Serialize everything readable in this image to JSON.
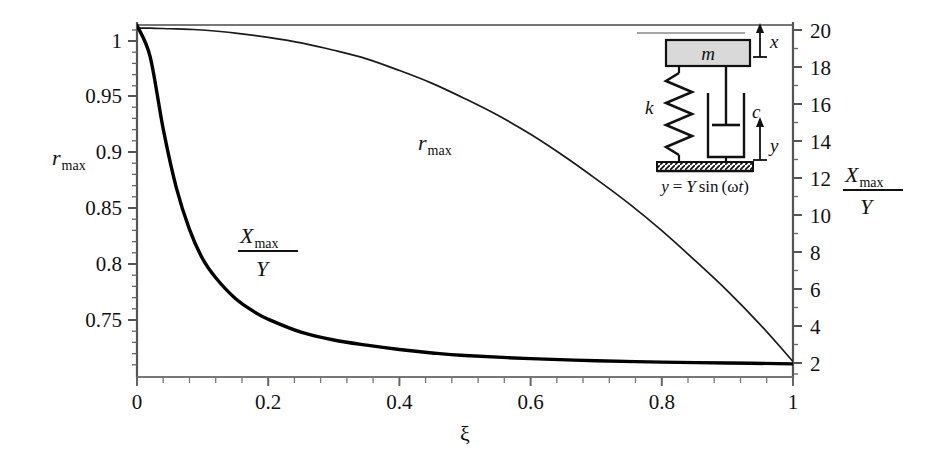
{
  "figure": {
    "name": "rmax-and-Xmax-over-Y-versus-damping-ratio",
    "background": "#ffffff",
    "axis_color": "#555555",
    "curve_color_thin": "#1a1a1a",
    "curve_color_thick": "#000000"
  },
  "chart_data": {
    "type": "line",
    "title": "",
    "xlabel": "ξ",
    "ylabel": "r_max",
    "ylabel_right": "X_max / Y",
    "grid": false,
    "legend": "inline-curve-labels",
    "xlim": [
      0,
      1
    ],
    "xticks": [
      0,
      0.2,
      0.4,
      0.6,
      0.8,
      1
    ],
    "xticklabels": [
      "0",
      "0.2",
      "0.4",
      "0.6",
      "0.8",
      "1"
    ],
    "x_minor_ticks_per_interval": 5,
    "ylim_left": [
      0.715,
      1.005
    ],
    "yticks_left": [
      0.75,
      0.8,
      0.85,
      0.9,
      0.95,
      1
    ],
    "yticklabels_left": [
      "0.75",
      "0.8",
      "0.85",
      "0.9",
      "0.95",
      "1"
    ],
    "ylim_right": [
      0.6,
      21.2
    ],
    "yticks_right": [
      2,
      4,
      6,
      8,
      10,
      12,
      14,
      16,
      18,
      20
    ],
    "yticklabels_right": [
      "2",
      "4",
      "6",
      "8",
      "10",
      "12",
      "14",
      "16",
      "18",
      "20"
    ],
    "series": [
      {
        "name": "r_max",
        "axis": "left",
        "label": "r_max",
        "style": "thin",
        "x": [
          0,
          0.02,
          0.05,
          0.08,
          0.1,
          0.15,
          0.2,
          0.25,
          0.3,
          0.35,
          0.4,
          0.45,
          0.5,
          0.55,
          0.6,
          0.65,
          0.7,
          0.75,
          0.8,
          0.85,
          0.9,
          0.95,
          1
        ],
        "y": [
          1.0,
          1.0,
          0.9995,
          0.999,
          0.9985,
          0.996,
          0.9925,
          0.988,
          0.982,
          0.975,
          0.9655,
          0.955,
          0.9425,
          0.929,
          0.9135,
          0.896,
          0.877,
          0.857,
          0.835,
          0.811,
          0.786,
          0.7585,
          0.7285
        ]
      },
      {
        "name": "Xmax_over_Y",
        "axis": "right",
        "label": "X_max/Y",
        "style": "thick",
        "x": [
          0,
          0.02,
          0.04,
          0.06,
          0.08,
          0.1,
          0.12,
          0.15,
          0.18,
          0.2,
          0.25,
          0.3,
          0.35,
          0.4,
          0.45,
          0.5,
          0.6,
          0.7,
          0.8,
          0.9,
          1
        ],
        "y": [
          21.0,
          19.2,
          15.0,
          11.6,
          9.2,
          7.5,
          6.4,
          5.2,
          4.4,
          4.0,
          3.25,
          2.8,
          2.5,
          2.25,
          2.05,
          1.9,
          1.72,
          1.6,
          1.52,
          1.47,
          1.42
        ]
      }
    ],
    "annotations": [
      {
        "name": "curve-label-rmax",
        "text": "r",
        "sub": "max",
        "x_px": 420,
        "y_px": 145
      },
      {
        "name": "curve-label-xmax-over-y",
        "numerator_main": "X",
        "numerator_sub": "max",
        "denominator": "Y",
        "x_px": 250,
        "y_px": 250
      }
    ]
  },
  "inset": {
    "name": "base-excited-mass-spring-damper",
    "mass_label": "m",
    "spring_label": "k",
    "damper_label": "c",
    "displacement_label_top": "x",
    "displacement_label_bottom": "y",
    "base_equation": "y = Y sin (ωt)",
    "base_equation_parts": {
      "y": "y",
      "equals": "=",
      "Y": "Y",
      "sin": "sin",
      "open": "(",
      "omega": "ω",
      "t": "t",
      "close": ")"
    },
    "mass_fill": "#d9d9d9",
    "ground_hatch": "true"
  }
}
